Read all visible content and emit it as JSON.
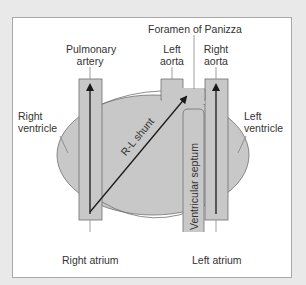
{
  "diagram": {
    "labels": {
      "foramen": "Foramen of Panizza",
      "pulmonary_artery_1": "Pulmonary",
      "pulmonary_artery_2": "artery",
      "left_aorta_1": "Left",
      "left_aorta_2": "aorta",
      "right_aorta_1": "Right",
      "right_aorta_2": "aorta",
      "right_ventricle_1": "Right",
      "right_ventricle_2": "ventricle",
      "left_ventricle_1": "Left",
      "left_ventricle_2": "ventricle",
      "shunt": "R-L shunt",
      "septum": "Ventricular septum",
      "right_atrium": "Right atrium",
      "left_atrium": "Left atrium"
    },
    "colors": {
      "fill": "#c8c8c8",
      "stroke": "#6e6e6e",
      "arrow": "#1a1a1a",
      "frame_border": "#a8a8a8",
      "background": "#e9e9e9"
    }
  }
}
